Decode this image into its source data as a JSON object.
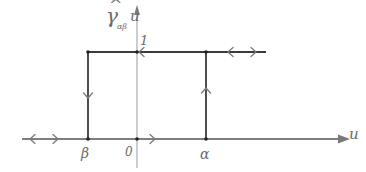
{
  "diagram": {
    "type": "hysteresis-loop",
    "y_axis_label": {
      "symbol": "γ",
      "accent": "^",
      "subscript": "αβ",
      "argument": "u"
    },
    "x_axis_label": "u",
    "tick_labels": {
      "top_level": "1",
      "beta": "β",
      "origin": "0",
      "alpha": "α"
    },
    "colors": {
      "loop_lines": "#3a3a3a",
      "axis_lines": "#8a8a8a",
      "arrows": "#7a7a7a",
      "labels": "#6a6a6a"
    },
    "structure": {
      "upper_branch": "output = 1, extends from β rightward",
      "lower_branch": "output = 0, extends from α leftward",
      "down_transition_at": "β",
      "up_transition_at": "α"
    }
  }
}
